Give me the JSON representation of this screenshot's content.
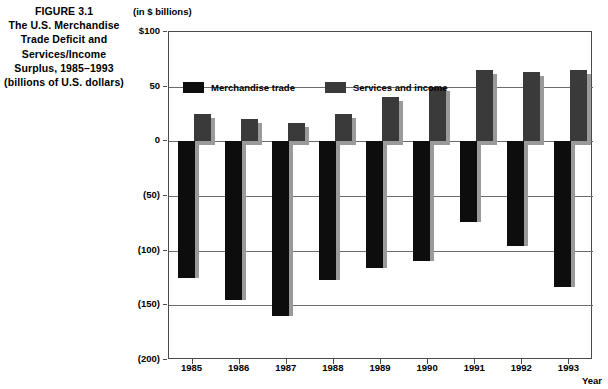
{
  "figure": {
    "caption_lines": [
      "FIGURE 3.1",
      "The U.S. Merchandise",
      "Trade Deficit and",
      "Services/Income",
      "Surplus, 1985–1993",
      "(billions of U.S. dollars)"
    ],
    "units_note": "(in $ billions)",
    "x_axis_title": "Year"
  },
  "colors": {
    "merchandise": "#0d0d0d",
    "services": "#3a3a3a",
    "shadow": "#9a9a9a",
    "frame": "#4a4a4a",
    "grid": "#6b6b6b",
    "background": "#ffffff"
  },
  "chart_data": {
    "type": "bar",
    "title": "The U.S. Merchandise Trade Deficit and Services/Income Surplus, 1985–1993 (billions of U.S. dollars)",
    "subtitle": "(in $ billions)",
    "xlabel": "Year",
    "ylabel": "",
    "categories": [
      "1985",
      "1986",
      "1987",
      "1988",
      "1989",
      "1990",
      "1991",
      "1992",
      "1993"
    ],
    "series": [
      {
        "name": "Merchandise trade",
        "color": "#0d0d0d",
        "values": [
          -125,
          -145,
          -160,
          -127,
          -116,
          -109,
          -74,
          -96,
          -133
        ]
      },
      {
        "name": "Services and income",
        "color": "#3a3a3a",
        "values": [
          25,
          20,
          17,
          25,
          41,
          50,
          65,
          63,
          65
        ]
      }
    ],
    "ylim": [
      -200,
      100
    ],
    "ytick_values": [
      100,
      50,
      0,
      -50,
      -100,
      -150,
      -200
    ],
    "ytick_labels": [
      "$100",
      "50",
      "0",
      "(50)",
      "(100)",
      "(150)",
      "(200)"
    ],
    "grid": true,
    "grid_axis": "y",
    "legend": [
      "Merchandise trade",
      "Services and income"
    ],
    "legend_position": "top-left-inside"
  }
}
